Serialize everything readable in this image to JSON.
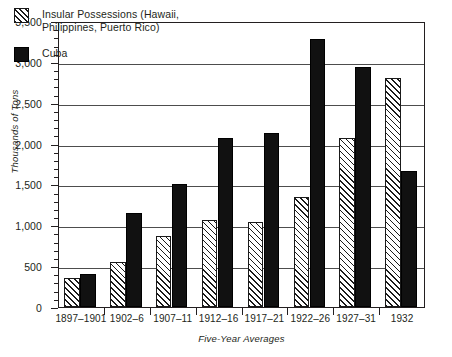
{
  "chart_data": {
    "type": "bar",
    "title": "",
    "xlabel": "Five-Year Averages",
    "ylabel": "Thousands of Tons",
    "ylim": [
      0,
      3500
    ],
    "ytick_values": [
      0,
      500,
      1000,
      1500,
      2000,
      2500,
      3000,
      3500
    ],
    "ytick_labels": [
      "0",
      "500",
      "1,000",
      "1,500",
      "2,000",
      "2,500",
      "3,000",
      "3,500"
    ],
    "yminor_interval": 100,
    "grid": true,
    "grid_axis": "y",
    "legend_position": "top-left-inside",
    "categories": [
      "1897–1901",
      "1902–6",
      "1907–11",
      "1912–16",
      "1917–21",
      "1922–26",
      "1927–31",
      "1932"
    ],
    "series": [
      {
        "name": "Insular Possessions (Hawaii,\nPhilippines, Puerto Rico)",
        "legend_label": "Insular Possessions (Hawaii,\nPhilippines, Puerto Rico)",
        "fill": "hatched-diagonal",
        "color": "#1a1a1a",
        "values": [
          350,
          550,
          870,
          1060,
          1045,
          1350,
          2065,
          2800
        ]
      },
      {
        "name": "Cuba",
        "legend_label": "Cuba",
        "fill": "solid-black",
        "color": "#111111",
        "values": [
          405,
          1150,
          1510,
          2070,
          2135,
          3280,
          2935,
          1665
        ]
      }
    ]
  },
  "legend": {
    "items": [
      {
        "label": "Insular Possessions (Hawaii,\nPhilippines, Puerto Rico)",
        "swatch": "hatched"
      },
      {
        "label": "Cuba",
        "swatch": "solid"
      }
    ]
  },
  "axes": {
    "y_title": "Thousands of Tons",
    "x_title": "Five-Year Averages"
  },
  "colors": {
    "axis": "#231f20",
    "grid": "#4d4d4d",
    "bar_solid": "#111111",
    "bar_hatch": "#1a1a1a",
    "background": "#ffffff"
  }
}
